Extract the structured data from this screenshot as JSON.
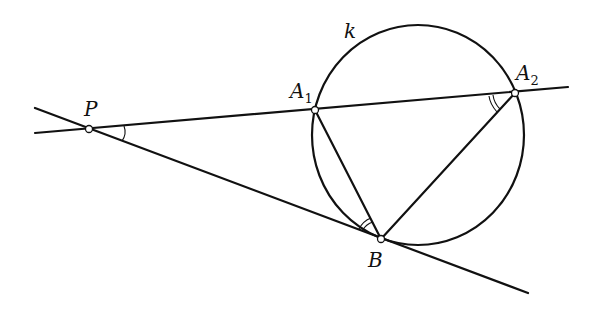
{
  "diagram": {
    "type": "geometry-tangent-secant",
    "circle": {
      "label": "k",
      "cx": 418,
      "cy": 135,
      "rx": 106,
      "ry": 110
    },
    "points": [
      {
        "id": "P",
        "label": "P",
        "sub": "",
        "x": 89,
        "y": 129
      },
      {
        "id": "A1",
        "label": "A",
        "sub": "1",
        "x": 315,
        "y": 110
      },
      {
        "id": "A2",
        "label": "A",
        "sub": "2",
        "x": 515,
        "y": 93
      },
      {
        "id": "B",
        "label": "B",
        "sub": "",
        "x": 381,
        "y": 239
      }
    ],
    "lines": [
      {
        "id": "secant",
        "desc": "line through P, A1, A2",
        "x1": 35,
        "y1": 133,
        "x2": 568,
        "y2": 87
      },
      {
        "id": "tangent",
        "desc": "tangent line through P and B",
        "x1": 35,
        "y1": 108,
        "x2": 528,
        "y2": 293
      },
      {
        "id": "chord-A1B",
        "x1": 315,
        "y1": 110,
        "x2": 381,
        "y2": 239
      },
      {
        "id": "chord-A2B",
        "x1": 515,
        "y1": 93,
        "x2": 381,
        "y2": 239
      }
    ],
    "angle_marks": [
      {
        "at": "P",
        "arcs": 1
      },
      {
        "at": "A2",
        "arcs": 2
      },
      {
        "at": "B",
        "arcs": 2
      }
    ]
  }
}
